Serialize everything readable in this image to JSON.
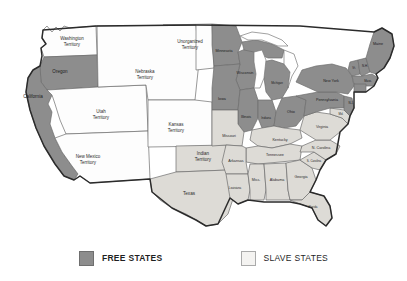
{
  "map": {
    "title": "Free States and Slave States of the United States",
    "colors": {
      "free_fill": "#8d8d8d",
      "slave_fill": "#dddbd6",
      "neutral_fill": "#fdfdfd",
      "border": "#6d6d6d",
      "coastline": "#2b2b2b",
      "background": "#ffffff"
    },
    "regions": [
      {
        "id": "washington-territory",
        "label": "Washington\nTerritory",
        "status": "neutral",
        "label_x": 72,
        "label_y": 42,
        "size": "terr"
      },
      {
        "id": "oregon",
        "label": "Oregon",
        "status": "free",
        "label_x": 60,
        "label_y": 72,
        "size": "md"
      },
      {
        "id": "california",
        "label": "California",
        "status": "free",
        "label_x": 33,
        "label_y": 97,
        "size": "md"
      },
      {
        "id": "utah-territory",
        "label": "Utah\nTerritory",
        "status": "neutral",
        "label_x": 101,
        "label_y": 115,
        "size": "terr"
      },
      {
        "id": "new-mexico-territory",
        "label": "New Mexico\nTerritory",
        "status": "neutral",
        "label_x": 88,
        "label_y": 160,
        "size": "terr"
      },
      {
        "id": "nebraska-territory",
        "label": "Nebraska\nTerritory",
        "status": "neutral",
        "label_x": 145,
        "label_y": 75,
        "size": "terr"
      },
      {
        "id": "kansas-territory",
        "label": "Kansas\nTerritory",
        "status": "neutral",
        "label_x": 176,
        "label_y": 128,
        "size": "terr"
      },
      {
        "id": "unorganized-territory",
        "label": "Unorganized\nTerritory",
        "status": "neutral",
        "label_x": 190,
        "label_y": 45,
        "size": "terr"
      },
      {
        "id": "indian-territory",
        "label": "Indian\nTerritory",
        "status": "slave",
        "label_x": 203,
        "label_y": 157,
        "size": "terr"
      },
      {
        "id": "texas",
        "label": "Texas",
        "status": "slave",
        "label_x": 189,
        "label_y": 194,
        "size": "md"
      },
      {
        "id": "minnesota",
        "label": "Minnesota",
        "status": "free",
        "label_x": 224,
        "label_y": 51,
        "size": "sm"
      },
      {
        "id": "wisconsin",
        "label": "Wisconsin",
        "status": "free",
        "label_x": 243,
        "label_y": 73,
        "size": "sm"
      },
      {
        "id": "iowa",
        "label": "Iowa",
        "status": "free",
        "label_x": 222,
        "label_y": 99,
        "size": "sm"
      },
      {
        "id": "michigan",
        "label": "Michigan",
        "status": "free",
        "label_x": 277,
        "label_y": 85,
        "size": "xs"
      },
      {
        "id": "illinois",
        "label": "Illinois",
        "status": "free",
        "label_x": 245,
        "label_y": 117,
        "size": "sm"
      },
      {
        "id": "indiana",
        "label": "Indiana",
        "status": "free",
        "label_x": 266,
        "label_y": 118,
        "size": "xs"
      },
      {
        "id": "ohio",
        "label": "Ohio",
        "status": "free",
        "label_x": 291,
        "label_y": 112,
        "size": "sm"
      },
      {
        "id": "missouri",
        "label": "Missouri",
        "status": "slave",
        "label_x": 229,
        "label_y": 136,
        "size": "sm"
      },
      {
        "id": "kentucky",
        "label": "Kentucky",
        "status": "slave",
        "label_x": 280,
        "label_y": 142,
        "size": "sm"
      },
      {
        "id": "tennessee",
        "label": "Tennessee",
        "status": "slave",
        "label_x": 277,
        "label_y": 155,
        "size": "sm"
      },
      {
        "id": "arkansas",
        "label": "Arkansas",
        "status": "slave",
        "label_x": 236,
        "label_y": 161,
        "size": "sm"
      },
      {
        "id": "louisiana",
        "label": "Louisiana",
        "status": "slave",
        "label_x": 233,
        "label_y": 188,
        "size": "xs"
      },
      {
        "id": "mississippi",
        "label": "Miss.",
        "status": "slave",
        "label_x": 255,
        "label_y": 178,
        "size": "sm"
      },
      {
        "id": "alabama",
        "label": "Alabama",
        "status": "slave",
        "label_x": 276,
        "label_y": 179,
        "size": "sm"
      },
      {
        "id": "georgia",
        "label": "Georgia",
        "status": "slave",
        "label_x": 300,
        "label_y": 177,
        "size": "sm"
      },
      {
        "id": "florida",
        "label": "Florida",
        "status": "slave",
        "label_x": 311,
        "label_y": 205,
        "size": "xs"
      },
      {
        "id": "south-carolina",
        "label": "S. Carolina",
        "status": "slave",
        "label_x": 312,
        "label_y": 162,
        "size": "xs"
      },
      {
        "id": "north-carolina",
        "label": "N. Carolina",
        "status": "slave",
        "label_x": 320,
        "label_y": 148,
        "size": "sm"
      },
      {
        "id": "virginia",
        "label": "Virginia",
        "status": "slave",
        "label_x": 320,
        "label_y": 127,
        "size": "sm"
      },
      {
        "id": "pennsylvania",
        "label": "Pennsylvania",
        "status": "free",
        "label_x": 328,
        "label_y": 99,
        "size": "sm"
      },
      {
        "id": "new-york",
        "label": "New York",
        "status": "free",
        "label_x": 333,
        "label_y": 82,
        "size": "sm"
      },
      {
        "id": "maine",
        "label": "Maine",
        "status": "free",
        "label_x": 376,
        "label_y": 44,
        "size": "sm"
      },
      {
        "id": "vermont",
        "label": "Vt.",
        "status": "free",
        "label_x": 355,
        "label_y": 68,
        "size": "xs"
      },
      {
        "id": "new-hampshire",
        "label": "N.H.",
        "status": "free",
        "label_x": 364,
        "label_y": 72,
        "size": "xs"
      },
      {
        "id": "massachusetts",
        "label": "Mass.",
        "status": "free",
        "label_x": 366,
        "label_y": 80,
        "size": "xs"
      },
      {
        "id": "new-jersey",
        "label": "N.J.",
        "status": "free",
        "label_x": 349,
        "label_y": 104,
        "size": "xs"
      },
      {
        "id": "maryland",
        "label": "Md.",
        "status": "slave",
        "label_x": 341,
        "label_y": 114,
        "size": "xs"
      }
    ]
  },
  "legend": {
    "free": {
      "label": "FREE STATES",
      "swatch": "free-swatch",
      "color": "#8d8d8d"
    },
    "slave": {
      "label": "SLAVE STATES",
      "swatch": "slave-swatch",
      "color": "#f4f3f1"
    }
  }
}
